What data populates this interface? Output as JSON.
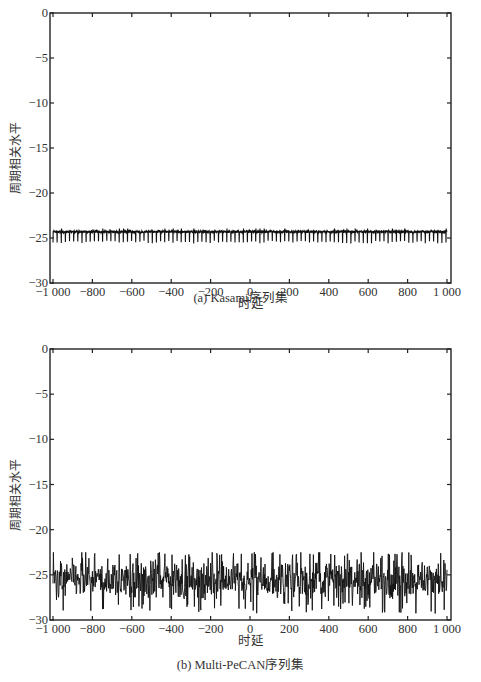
{
  "chart_data": [
    {
      "type": "line",
      "panel": "a",
      "caption": "(a) Kasami序列集",
      "title": "",
      "xlabel": "时延",
      "ylabel": "周期相关水平",
      "xlim": [
        -1000,
        1000
      ],
      "ylim": [
        -30,
        0
      ],
      "xticks": [
        -1000,
        -800,
        -600,
        -400,
        -200,
        0,
        200,
        400,
        600,
        800,
        1000
      ],
      "xtick_labels": [
        "−1 000",
        "−800",
        "−600",
        "−400",
        "−200",
        "0",
        "200",
        "400",
        "600",
        "800",
        "1 000"
      ],
      "yticks": [
        0,
        -5,
        -10,
        -15,
        -20,
        -25,
        -30
      ],
      "ytick_labels": [
        "0",
        "−5",
        "−10",
        "−15",
        "−20",
        "−25",
        "−30"
      ],
      "grid": false,
      "series": [
        {
          "name": "Kasami",
          "baseline": -24.3,
          "dip_min": -25.6,
          "dip_period": 21,
          "description": "nearly flat level ~-24.3 dB with periodic dips to ~-25.5"
        }
      ]
    },
    {
      "type": "line",
      "panel": "b",
      "caption": "(b) Multi-PeCAN序列集",
      "title": "",
      "xlabel": "时延",
      "ylabel": "周期相关水平",
      "xlim": [
        -1000,
        1000
      ],
      "ylim": [
        -30,
        0
      ],
      "xticks": [
        -1000,
        -800,
        -600,
        -400,
        -200,
        0,
        200,
        400,
        600,
        800,
        1000
      ],
      "xtick_labels": [
        "−1 000",
        "−800",
        "−600",
        "−400",
        "−200",
        "0",
        "200",
        "400",
        "600",
        "800",
        "1 000"
      ],
      "yticks": [
        0,
        -5,
        -10,
        -15,
        -20,
        -25,
        -30
      ],
      "ytick_labels": [
        "0",
        "−5",
        "−10",
        "−15",
        "−20",
        "−25",
        "−30"
      ],
      "grid": false,
      "series": [
        {
          "name": "Multi-PeCAN",
          "mean": -25.5,
          "max": -22.8,
          "min": -29.3,
          "description": "noisy fluctuation between ~-23 and ~-29, centered ~-25.5"
        }
      ]
    }
  ],
  "figure": {
    "caption_a": "(a) Kasami序列集",
    "caption_b": "(b) Multi-PeCAN序列集",
    "xlabel": "时延",
    "ylabel": "周期相关水平"
  }
}
